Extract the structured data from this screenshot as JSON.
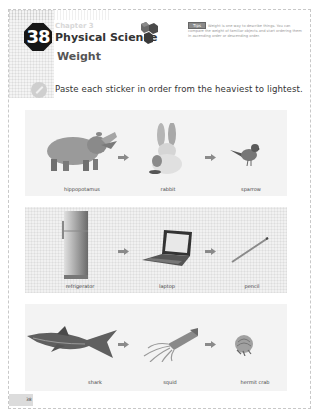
{
  "header": {
    "chapter_number": "38",
    "chapter_label": "Chapter 3",
    "chapter_title": "Physical Science",
    "lesson_title": "Weight",
    "tip_tag": "Tips",
    "tip_text": "Weight is one way to describe things. You can compare the weight of familiar objects and start ordering them in ascending order or descending order."
  },
  "instruction": "Paste each sticker in order from the heaviest to lightest.",
  "rows": [
    {
      "items": [
        {
          "label": "hippopotamus",
          "icon": "hippopotamus-image"
        },
        {
          "label": "rabbit",
          "icon": "rabbit-image"
        },
        {
          "label": "sparrow",
          "icon": "sparrow-image"
        }
      ]
    },
    {
      "items": [
        {
          "label": "refrigerator",
          "icon": "refrigerator-image"
        },
        {
          "label": "laptop",
          "icon": "laptop-image"
        },
        {
          "label": "pencil",
          "icon": "pencil-image"
        }
      ]
    },
    {
      "items": [
        {
          "label": "shark",
          "icon": "shark-image"
        },
        {
          "label": "squid",
          "icon": "squid-image"
        },
        {
          "label": "hermit crab",
          "icon": "hermit-crab-image"
        }
      ]
    }
  ],
  "footer": {
    "page_number": "38"
  },
  "colors": {
    "badge": "#161616",
    "panel": "#f3f3f3",
    "arrow": "#8a8a8a"
  }
}
